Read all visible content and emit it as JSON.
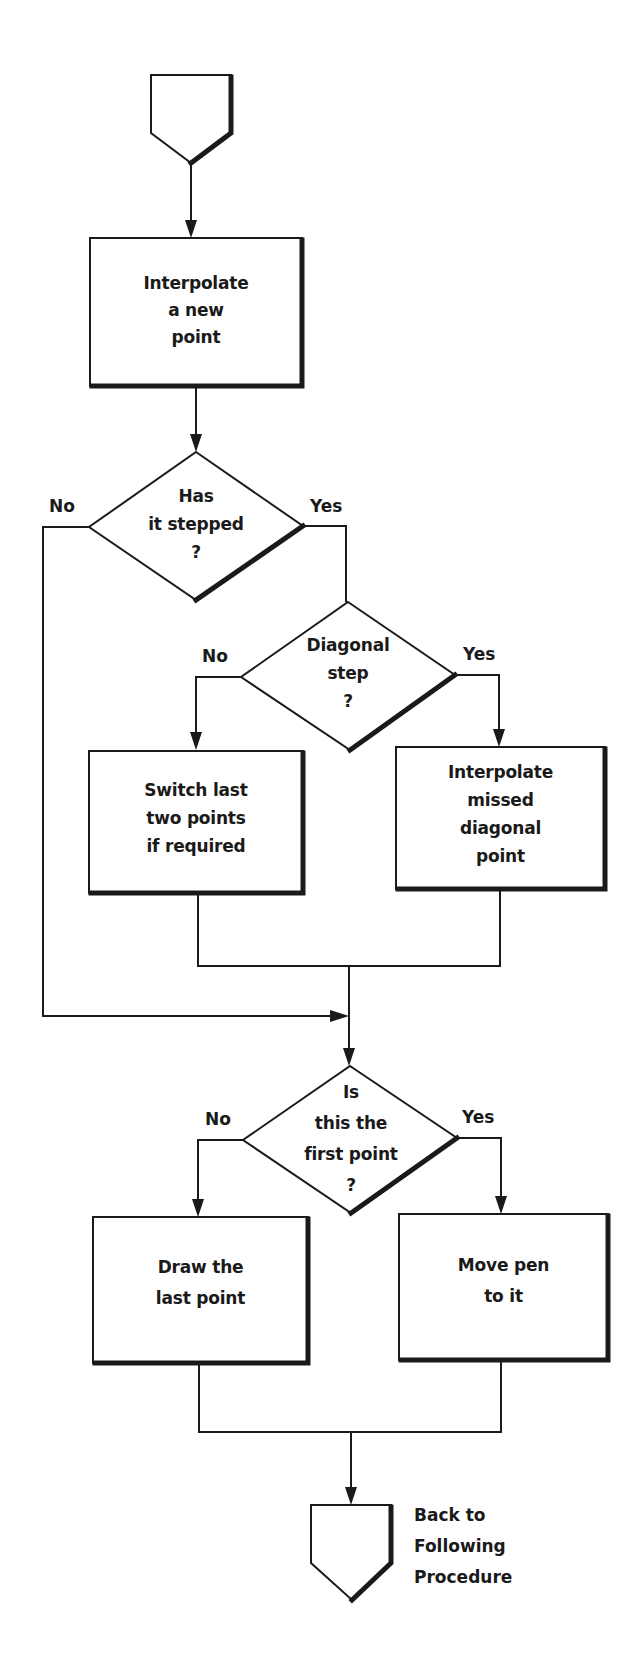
{
  "diagram": {
    "type": "flowchart",
    "start_connector": {
      "label": ""
    },
    "nodes": {
      "interpolate_new": {
        "kind": "process",
        "text": "Interpolate\na new\npoint"
      },
      "has_stepped": {
        "kind": "decision",
        "text": "Has\nit stepped\n?",
        "no_label": "No",
        "yes_label": "Yes"
      },
      "diagonal_step": {
        "kind": "decision",
        "text": "Diagonal\nstep\n?",
        "no_label": "No",
        "yes_label": "Yes"
      },
      "switch_last": {
        "kind": "process",
        "text": "Switch last\ntwo points\nif required"
      },
      "interpolate_missed": {
        "kind": "process",
        "text": "Interpolate\nmissed\ndiagonal\npoint"
      },
      "first_point": {
        "kind": "decision",
        "text": "Is\nthis the\nfirst point\n?",
        "no_label": "No",
        "yes_label": "Yes"
      },
      "draw_last": {
        "kind": "process",
        "text": "Draw the\nlast point"
      },
      "move_pen": {
        "kind": "process",
        "text": "Move pen\nto it"
      }
    },
    "end_connector": {
      "label": "Back to\nFollowing\nProcedure"
    },
    "edges": [
      {
        "from": "start",
        "to": "interpolate_new"
      },
      {
        "from": "interpolate_new",
        "to": "has_stepped"
      },
      {
        "from": "has_stepped",
        "to": "first_point",
        "label": "No"
      },
      {
        "from": "has_stepped",
        "to": "diagonal_step",
        "label": "Yes"
      },
      {
        "from": "diagonal_step",
        "to": "switch_last",
        "label": "No"
      },
      {
        "from": "diagonal_step",
        "to": "interpolate_missed",
        "label": "Yes"
      },
      {
        "from": "switch_last",
        "to": "first_point"
      },
      {
        "from": "interpolate_missed",
        "to": "first_point"
      },
      {
        "from": "first_point",
        "to": "draw_last",
        "label": "No"
      },
      {
        "from": "first_point",
        "to": "move_pen",
        "label": "Yes"
      },
      {
        "from": "draw_last",
        "to": "end"
      },
      {
        "from": "move_pen",
        "to": "end"
      }
    ]
  }
}
